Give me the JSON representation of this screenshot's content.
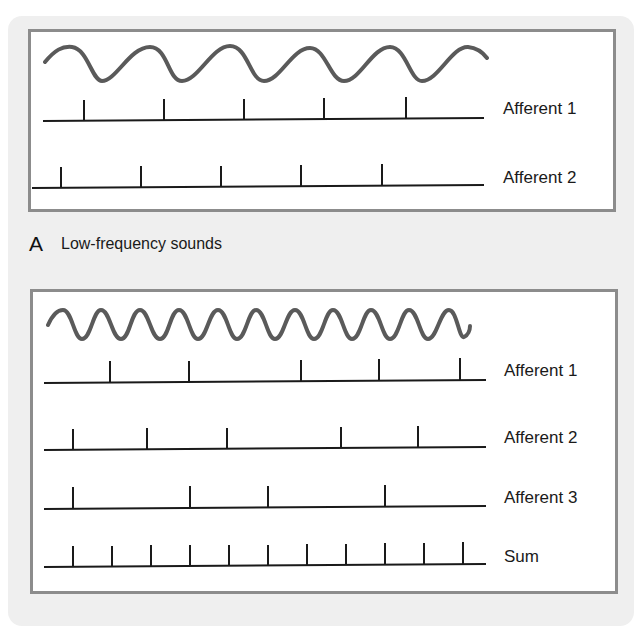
{
  "panel_a": {
    "letter": "A",
    "caption": "Low-frequency sounds",
    "rows": [
      {
        "label": "Afferent 1"
      },
      {
        "label": "Afferent 2"
      }
    ]
  },
  "panel_b": {
    "rows": [
      {
        "label": "Afferent 1"
      },
      {
        "label": "Afferent 2"
      },
      {
        "label": "Afferent 3"
      },
      {
        "label": "Sum"
      }
    ]
  },
  "colors": {
    "background": "#ffffff",
    "panel": "#efefef",
    "box_border": "#8c8c8c",
    "wave": "#5a5a5a",
    "spike": "#1a1a1a"
  }
}
